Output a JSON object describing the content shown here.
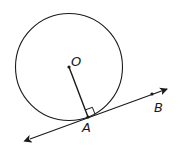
{
  "diagram": {
    "type": "geometry",
    "labels": {
      "center": "O",
      "tangent_point": "A",
      "line_point": "B"
    },
    "points": {
      "O": [
        69,
        67
      ],
      "A": [
        88,
        117
      ],
      "B": [
        152,
        94
      ]
    },
    "circle": {
      "cx": 69,
      "cy": 67,
      "r": 53
    },
    "colors": {
      "stroke": "#1a1a1a",
      "background": "#ffffff"
    }
  }
}
